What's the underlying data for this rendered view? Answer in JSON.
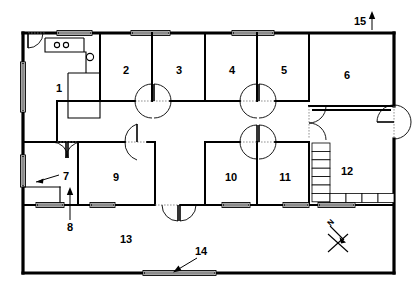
{
  "drawing": {
    "title": "Building Floor Plan",
    "type": "architectural-floor-plan",
    "line_color": "#000000",
    "background_color": "#ffffff"
  },
  "rooms": [
    {
      "id": "room-1",
      "label": "1",
      "x": 59,
      "y": 89
    },
    {
      "id": "room-2",
      "label": "2",
      "x": 126,
      "y": 71
    },
    {
      "id": "room-3",
      "label": "3",
      "x": 179,
      "y": 71
    },
    {
      "id": "room-4",
      "label": "4",
      "x": 232,
      "y": 71
    },
    {
      "id": "room-5",
      "label": "5",
      "x": 284,
      "y": 71
    },
    {
      "id": "room-6",
      "label": "6",
      "x": 347,
      "y": 76
    },
    {
      "id": "room-9",
      "label": "9",
      "x": 116,
      "y": 178
    },
    {
      "id": "room-10",
      "label": "10",
      "x": 231,
      "y": 178
    },
    {
      "id": "room-11",
      "label": "11",
      "x": 285,
      "y": 178
    },
    {
      "id": "room-12",
      "label": "12",
      "x": 347,
      "y": 172
    },
    {
      "id": "room-13",
      "label": "13",
      "x": 126,
      "y": 240
    }
  ],
  "callouts": [
    {
      "id": "callout-7",
      "label": "7",
      "label_x": 66,
      "label_y": 177,
      "leader": "from label left-down to window on west wall"
    },
    {
      "id": "callout-8",
      "label": "8",
      "label_x": 70,
      "label_y": 228,
      "leader": "from label up to doorway"
    },
    {
      "id": "callout-14",
      "label": "14",
      "label_x": 201,
      "label_y": 252,
      "leader": "from label down-left to window in south wall"
    },
    {
      "id": "callout-15",
      "label": "15",
      "label_x": 360,
      "label_y": 22,
      "leader": "arrow pointing up to north wall"
    }
  ],
  "compass": {
    "id": "compass-rose",
    "label": "N",
    "label_x": 332,
    "label_y": 224,
    "orientation": "north arrow pointing up-left"
  },
  "fixtures": {
    "stove_burners": 2,
    "sink_count": 1,
    "stair_vertical_treads": 7,
    "stair_horizontal_treads": 4
  },
  "openings": {
    "windows": 10,
    "single_doors": 4,
    "double_doors": 5
  }
}
